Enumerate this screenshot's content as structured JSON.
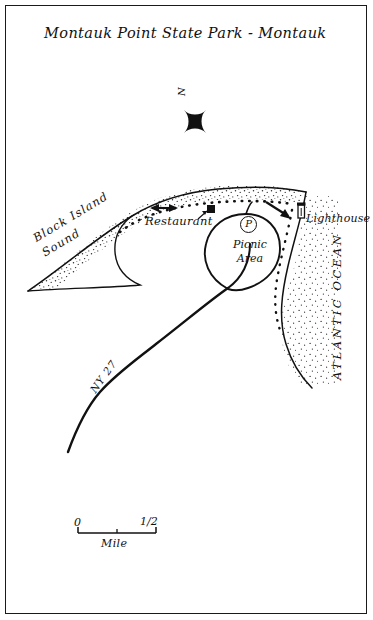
{
  "map": {
    "title": "Montauk Point State Park - Montauk",
    "north_label": "N",
    "water_bodies": [
      {
        "name": "block-island-sound",
        "label": "Block Island Sound"
      },
      {
        "name": "atlantic-ocean",
        "label": "ATLANTIC OCEAN"
      }
    ],
    "features": [
      {
        "name": "restaurant",
        "label": "Restaurant"
      },
      {
        "name": "lighthouse",
        "label": "Lighthouse"
      },
      {
        "name": "picnic-area",
        "label": "Picnic Area"
      },
      {
        "name": "parking",
        "label": "P"
      }
    ],
    "roads": [
      {
        "name": "ny-27",
        "label": "NY 27"
      }
    ],
    "scale_bar": {
      "start_label": "0",
      "end_label": "1/2",
      "unit_label": "Mile"
    },
    "colors": {
      "ink": "#111111",
      "paper": "#ffffff",
      "stipple": "#2b2b2b"
    }
  }
}
